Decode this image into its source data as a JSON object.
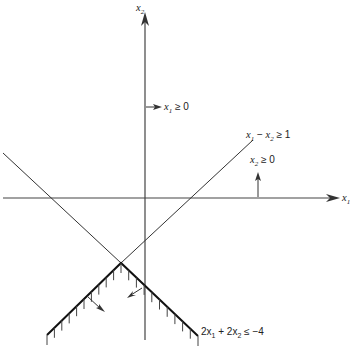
{
  "diagram": {
    "axes": {
      "x_label": "x",
      "x_label_sub": "1",
      "y_label": "x",
      "y_label_sub": "2"
    },
    "constraints": [
      {
        "id": "x1-nonneg",
        "label_main": "x",
        "label_sub": "1",
        "label_rel": " ≥ 0"
      },
      {
        "id": "x2-nonneg",
        "label_main": "x",
        "label_sub": "2",
        "label_rel": " ≥ 0"
      },
      {
        "id": "x1-minus-x2",
        "label_a": "x",
        "label_a_sub": "1",
        "label_mid": " − ",
        "label_b": "x",
        "label_b_sub": "2",
        "label_rel": " ≥ 1"
      },
      {
        "id": "sum-constraint",
        "label_a": "2x",
        "label_a_sub": "1",
        "label_mid": " + 2x",
        "label_b_sub": "2",
        "label_rel": " ≤ −4"
      }
    ],
    "colors": {
      "ink": "#333333",
      "background": "#ffffff"
    }
  }
}
